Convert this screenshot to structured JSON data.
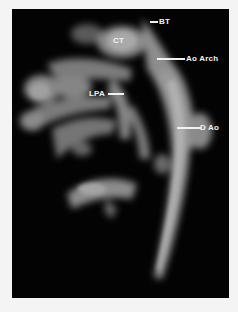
{
  "figure": {
    "type": "3D MR angiography rendering",
    "background_color": "#030303",
    "labels": {
      "bt": "BT",
      "ct": "CT",
      "ao_arch": "Ao Arch",
      "lpa": "LPA",
      "d_ao": "D Ao"
    }
  }
}
